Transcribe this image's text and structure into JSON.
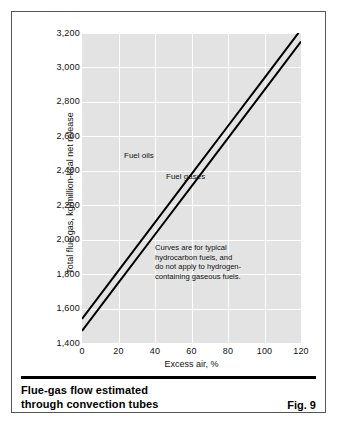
{
  "figure": {
    "caption_line1": "Flue-gas flow estimated",
    "caption_line2": "through convection tubes",
    "fig_number": "Fig. 9"
  },
  "annotation": {
    "line1": "Curves are for typical",
    "line2": "hydrocarbon fuels, and",
    "line3": "do not apply to hydrogen-",
    "line4": "containing gaseous fuels."
  },
  "chart_data": {
    "type": "line",
    "title": "",
    "xlabel": "Excess air, %",
    "ylabel": "Total flue gas, kg/million-kcal net release",
    "xlim": [
      0,
      120
    ],
    "ylim": [
      1400,
      3200
    ],
    "xticks": [
      "0",
      "20",
      "40",
      "60",
      "80",
      "100",
      "120"
    ],
    "xtick_values": [
      0,
      20,
      40,
      60,
      80,
      100,
      120
    ],
    "yticks": [
      "1,400",
      "1,600",
      "1,800",
      "2,000",
      "2,200",
      "2,400",
      "2,600",
      "2,800",
      "3,000",
      "3,200"
    ],
    "ytick_values": [
      1400,
      1600,
      1800,
      2000,
      2200,
      2400,
      2600,
      2800,
      3000,
      3200
    ],
    "grid": true,
    "grid_color": "#ffffff",
    "plot_bg": "#e3e3e3",
    "line_color": "#000000",
    "legend": "inline-labels",
    "series": [
      {
        "name": "Fuel oils",
        "label": "Fuel oils",
        "x": [
          0,
          20,
          40,
          60,
          80,
          100,
          120
        ],
        "values": [
          1540,
          1820,
          2100,
          2380,
          2660,
          2940,
          3220
        ]
      },
      {
        "name": "Fuel gases",
        "label": "Fuel gases",
        "x": [
          0,
          20,
          40,
          60,
          80,
          100,
          120
        ],
        "values": [
          1470,
          1750,
          2030,
          2310,
          2590,
          2870,
          3150
        ]
      }
    ],
    "annotations": [
      "Curves are for typical",
      "hydrocarbon fuels, and",
      "do not apply to hydrogen-",
      "containing gaseous fuels."
    ]
  }
}
